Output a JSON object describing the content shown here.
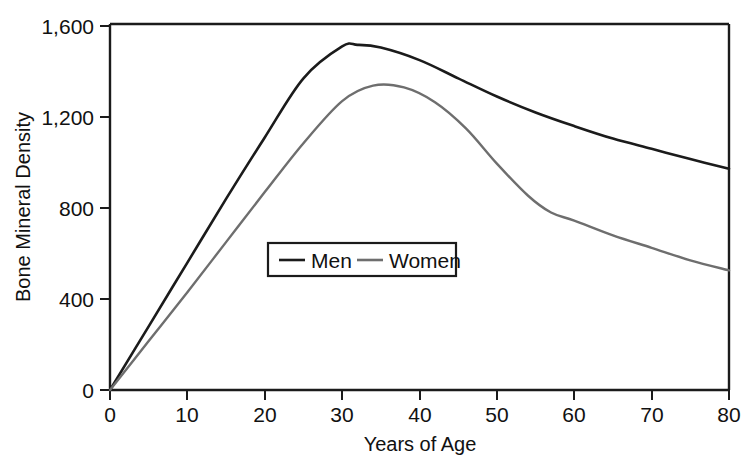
{
  "chart_data": {
    "type": "line",
    "title": "",
    "xlabel": "Years of Age",
    "ylabel": "Bone Mineral Density",
    "xlim": [
      0,
      80
    ],
    "ylim": [
      0,
      1600
    ],
    "grid": false,
    "legend_position": "center-left-inside",
    "x_ticks": [
      0,
      10,
      20,
      30,
      40,
      50,
      60,
      70,
      80
    ],
    "x_tick_labels": [
      "0",
      "10",
      "20",
      "30",
      "40",
      "50",
      "60",
      "70",
      "80"
    ],
    "y_ticks": [
      0,
      400,
      800,
      1200,
      1600
    ],
    "y_tick_labels": [
      "0",
      "400",
      "800",
      "1,200",
      "1,600"
    ],
    "series": [
      {
        "name": "Men",
        "color": "#1b1b1b",
        "stroke_width": 2.6,
        "x": [
          0,
          5,
          10,
          15,
          20,
          25,
          30,
          32,
          35,
          40,
          45,
          50,
          55,
          60,
          65,
          70,
          75,
          80
        ],
        "values": [
          0,
          280,
          560,
          840,
          1110,
          1370,
          1510,
          1517,
          1505,
          1450,
          1370,
          1290,
          1220,
          1160,
          1105,
          1060,
          1015,
          973
        ]
      },
      {
        "name": "Women",
        "color": "#6e6e6e",
        "stroke_width": 2.4,
        "x": [
          0,
          5,
          10,
          15,
          20,
          25,
          30,
          34,
          38,
          42,
          46,
          50,
          54,
          57,
          60,
          65,
          70,
          75,
          80
        ],
        "values": [
          0,
          215,
          430,
          650,
          870,
          1085,
          1270,
          1338,
          1330,
          1265,
          1150,
          995,
          855,
          780,
          745,
          680,
          625,
          570,
          526
        ]
      }
    ],
    "annotations": []
  },
  "legend": {
    "entries": [
      {
        "label": "Men",
        "color": "#1b1b1b"
      },
      {
        "label": "Women",
        "color": "#6e6e6e"
      }
    ]
  },
  "axes": {
    "x_title": "Years of Age",
    "y_title": "Bone Mineral Density",
    "x_labels": [
      "0",
      "10",
      "20",
      "30",
      "40",
      "50",
      "60",
      "70",
      "80"
    ],
    "y_labels": [
      "1,600",
      "1,200",
      "800",
      "400",
      "0"
    ]
  }
}
